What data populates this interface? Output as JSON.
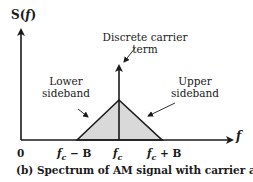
{
  "diagram": {
    "y_axis_label": "S(f)",
    "y_axis_label_parts": {
      "S": "S(",
      "f": "f",
      "close": ")"
    },
    "x_axis_label": "f",
    "origin_label": "0",
    "annotations": {
      "carrier": [
        "Discrete carrier",
        "term"
      ],
      "lower": [
        "Lower",
        "sideband"
      ],
      "upper": [
        "Upper",
        "sideband"
      ]
    },
    "ticks": {
      "left": {
        "f": "f",
        "sub": "c",
        "rest": " − B"
      },
      "center": {
        "f": "f",
        "sub": "c"
      },
      "right": {
        "f": "f",
        "sub": "c",
        "rest": " + B"
      }
    },
    "caption": {
      "text": "(b) Spectrum of AM signal with carrier at ",
      "f": "f",
      "sub": "c"
    },
    "colors": {
      "stroke": "#1a1a1a",
      "fill": "#d9d9d9",
      "background": "#ffffff"
    }
  }
}
